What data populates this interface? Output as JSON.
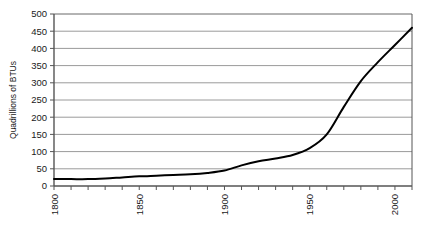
{
  "chart_data": {
    "type": "line",
    "title": "",
    "subtitle": "",
    "xlabel": "",
    "ylabel": "Quadrillions of BTUs",
    "xlim": [
      1800,
      2010
    ],
    "ylim": [
      0,
      500
    ],
    "grid": true,
    "grid_axis": "y",
    "legend": false,
    "legend_position": "none",
    "y_ticks": [
      0,
      50,
      100,
      150,
      200,
      250,
      300,
      350,
      400,
      450,
      500
    ],
    "y_tick_labels": [
      "0",
      "50",
      "100",
      "150",
      "200",
      "250",
      "300",
      "350",
      "400",
      "450",
      "500"
    ],
    "x_ticks": [
      1800,
      1810,
      1820,
      1830,
      1840,
      1850,
      1860,
      1870,
      1880,
      1890,
      1900,
      1910,
      1920,
      1930,
      1940,
      1950,
      1960,
      1970,
      1980,
      1990,
      2000,
      2010
    ],
    "x_tick_labels": [
      "1800",
      "",
      "",
      "",
      "",
      "1850",
      "",
      "",
      "",
      "",
      "1900",
      "",
      "",
      "",
      "",
      "1950",
      "",
      "",
      "",
      "",
      "2000",
      ""
    ],
    "x_labels_rotated": true,
    "x_label_rotation": -90,
    "series": [
      {
        "name": "Total energy consumption",
        "color": "#000000",
        "line_width": 2,
        "x": [
          1800,
          1810,
          1820,
          1830,
          1840,
          1850,
          1860,
          1870,
          1880,
          1890,
          1900,
          1910,
          1920,
          1930,
          1940,
          1950,
          1960,
          1970,
          1980,
          1990,
          2000,
          2010
        ],
        "values": [
          20,
          20,
          20,
          22,
          25,
          28,
          30,
          32,
          34,
          38,
          45,
          60,
          72,
          80,
          90,
          110,
          150,
          230,
          305,
          360,
          410,
          460
        ]
      }
    ],
    "colors": {
      "line": "#000000",
      "grid": "#9a9a9a",
      "axis": "#555555",
      "background": "#ffffff",
      "text": "#1a1a1a"
    }
  },
  "axes": {
    "y_axis_title": "Quadrillions of BTUs"
  }
}
